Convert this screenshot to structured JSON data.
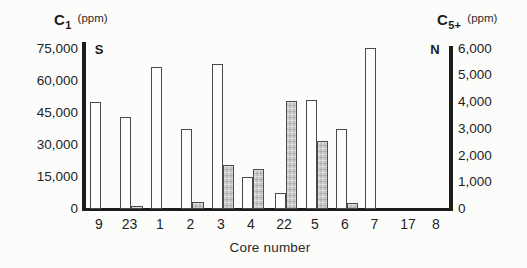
{
  "figure": {
    "left_axis": {
      "title_symbol": "C",
      "title_subscript": "1",
      "title_unit": "(ppm)",
      "end_label": "S",
      "tick_labels": [
        "75,000",
        "60,000",
        "45,000",
        "30,000",
        "15,000",
        "0"
      ],
      "max": 75000
    },
    "right_axis": {
      "title_symbol": "C",
      "title_subscript": "5+",
      "title_unit": "(ppm)",
      "end_label": "N",
      "tick_labels": [
        "6,000",
        "5,000",
        "4,000",
        "3,000",
        "2,000",
        "1,000",
        "0"
      ],
      "max": 6000
    },
    "x_axis": {
      "title": "Core number"
    }
  },
  "chart_data": {
    "type": "bar",
    "categories": [
      "9",
      "23",
      "1",
      "2",
      "3",
      "4",
      "22",
      "5",
      "6",
      "7",
      "17",
      "8"
    ],
    "series": [
      {
        "name": "C1 (ppm)",
        "axis": "left",
        "bar_style": "open-white",
        "values": [
          50000,
          43000,
          66500,
          37500,
          68000,
          15000,
          7500,
          51000,
          37500,
          75500,
          null,
          null
        ]
      },
      {
        "name": "C5+ (ppm)",
        "axis": "right",
        "bar_style": "stippled-gray",
        "values": [
          null,
          120,
          null,
          250,
          1650,
          1500,
          4050,
          2550,
          220,
          null,
          null,
          null
        ]
      }
    ],
    "title": "",
    "xlabel": "Core number",
    "ylabel_left": "C1 (ppm)",
    "ylabel_right": "C5+ (ppm)",
    "ylim_left": [
      0,
      75000
    ],
    "ylim_right": [
      0,
      6000
    ],
    "grid": false,
    "legend": "none",
    "orientation_labels": {
      "left_end": "S",
      "right_end": "N"
    }
  },
  "colors": {
    "background": "#fcfcfb",
    "axis_line": "#1c1c1c",
    "text": "#1b1b1b",
    "open_bar_fill": "#fdfdfc",
    "stippled_bar_fill": "#c9c9c9",
    "bar_stroke": "#4a4a4a"
  }
}
